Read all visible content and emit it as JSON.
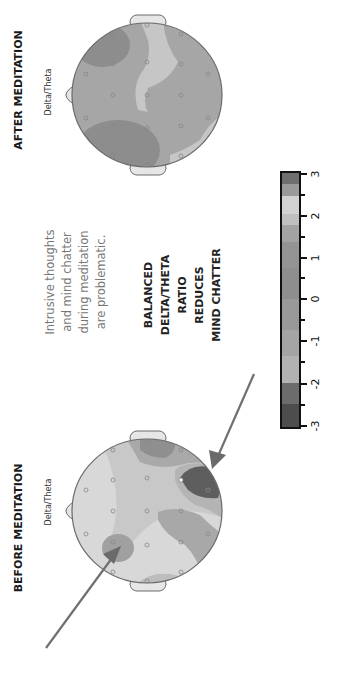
{
  "panels": {
    "before": {
      "title": "BEFORE MEDITATION",
      "subtitle": "Delta/Theta"
    },
    "after": {
      "title": "AFTER MEDITATION",
      "subtitle": "Delta/Theta"
    }
  },
  "caption": {
    "lines": [
      "Intrusive thoughts",
      "and mind chatter",
      "during meditation",
      "are problematic."
    ]
  },
  "message": {
    "lines": [
      "BALANCED",
      "DELTA/THETA",
      "RATIO",
      "REDUCES",
      "MIND CHATTER"
    ]
  },
  "colorbar": {
    "ticks": [
      "-3",
      "-2",
      "-1",
      "0",
      "1",
      "2",
      "3"
    ],
    "colors_bottom_to_top": [
      "#4a4a4a",
      "#6a6a6a",
      "#b2b2b2",
      "#a4a4a4",
      "#999999",
      "#8e8e8e",
      "#8c8c8c",
      "#949494",
      "#a3a3a3",
      "#c8c8c8",
      "#d2d2d2",
      "#9a9a9a",
      "#6e6e6e"
    ]
  },
  "colors": {
    "arrow": "#707070",
    "head_outline": "#6a6a6a"
  }
}
